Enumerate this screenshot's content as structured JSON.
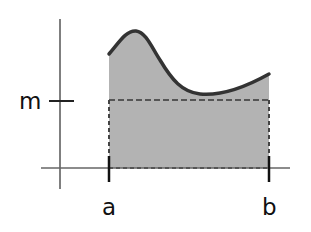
{
  "diagram": {
    "type": "mean-value-theorem-integral",
    "labels": {
      "m": "m",
      "a": "a",
      "b": "b"
    },
    "colors": {
      "background": "#ffffff",
      "fill": "#b3b3b3",
      "curve": "#333333",
      "axes": "#555555",
      "dashed": "#555555",
      "ticks": "#111111"
    },
    "elements": [
      "y-axis",
      "x-axis",
      "curve f(x) from a to b",
      "shaded area under curve",
      "dashed rectangle of height m from a to b",
      "tick at m on y-axis",
      "ticks at a and b on x-axis"
    ]
  }
}
